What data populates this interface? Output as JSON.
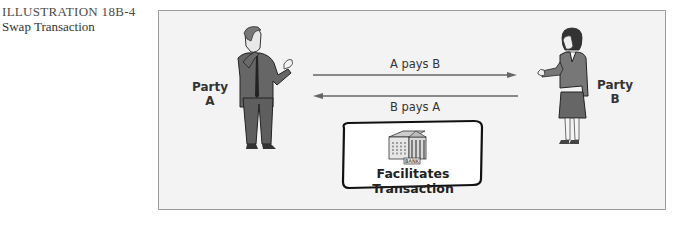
{
  "caption": {
    "number": "ILLUSTRATION 18B-4",
    "title": "Swap Transaction"
  },
  "diagram": {
    "party_a": {
      "line1": "Party",
      "line2": "A"
    },
    "party_b": {
      "line1": "Party",
      "line2": "B"
    },
    "flows": [
      {
        "label": "A pays B",
        "direction": "A-to-B"
      },
      {
        "label": "B pays A",
        "direction": "B-to-A"
      }
    ],
    "intermediary": {
      "icon": "bank-building-icon",
      "sign": "BANK",
      "label": "Facilitates Transaction"
    },
    "figures": [
      {
        "name": "man-figure",
        "represents": "Party A"
      },
      {
        "name": "woman-figure",
        "represents": "Party B"
      }
    ]
  }
}
